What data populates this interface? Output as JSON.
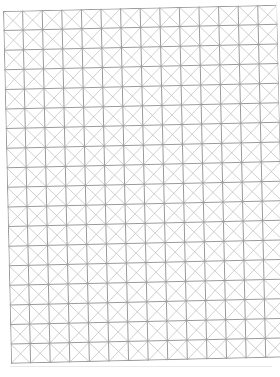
{
  "sheet": {
    "type": "diagonal-grid-paper",
    "columns": 14,
    "rows": 18,
    "cell_size_px": 19.6,
    "rotation_deg": -1.3,
    "colors": {
      "background": "#ffffff",
      "grid_line": "#9a9a9a",
      "diagonal_line": "#bdbdbd",
      "border": "#a0a0a0"
    },
    "grid_line_width": 1,
    "diagonal_line_width": 0.7
  }
}
